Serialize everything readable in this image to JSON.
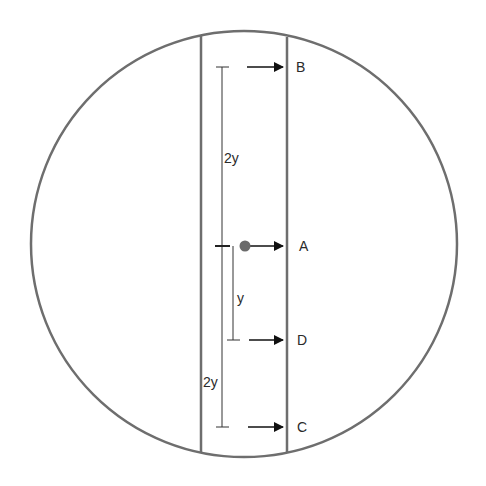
{
  "diagram": {
    "colors": {
      "outline": "#6e6e6e",
      "arrow": "#111111",
      "dot": "#6a6a6a",
      "text": "#2a2a2a"
    },
    "circle": {
      "cx": 244,
      "cy": 244,
      "r": 213
    },
    "strip": {
      "left_x": 201,
      "right_x": 287
    },
    "points": [
      {
        "label": "B",
        "y": 67
      },
      {
        "label": "A",
        "y": 246
      },
      {
        "label": "D",
        "y": 340
      },
      {
        "label": "C",
        "y": 427
      }
    ],
    "dimensions": [
      {
        "label": "2y",
        "from": "B",
        "to": "A"
      },
      {
        "label": "y",
        "from": "A",
        "to": "D"
      },
      {
        "label": "2y",
        "from": "A",
        "to": "C"
      }
    ],
    "labels": {
      "B": "B",
      "A": "A",
      "D": "D",
      "C": "C",
      "dim_upper": "2y",
      "dim_middle": "y",
      "dim_lower": "2y"
    }
  }
}
